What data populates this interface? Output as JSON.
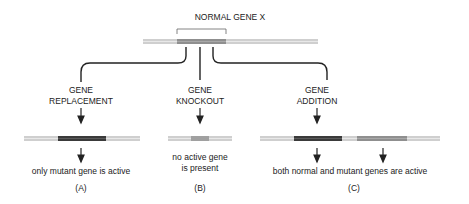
{
  "title": "NORMAL GENE X",
  "branches": [
    {
      "id": "A",
      "label_line1": "GENE",
      "label_line2": "REPLACEMENT",
      "result": "only mutant gene is active",
      "panel": "(A)"
    },
    {
      "id": "B",
      "label_line1": "GENE",
      "label_line2": "KNOCKOUT",
      "result_line1": "no active gene",
      "result_line2": "is present",
      "panel": "(B)"
    },
    {
      "id": "C",
      "label_line1": "GENE",
      "label_line2": "ADDITION",
      "result": "both normal and mutant genes are active",
      "panel": "(C)"
    }
  ],
  "colors": {
    "dna_light": "#c8c8c8",
    "normal_gene": "#909090",
    "mutant_gene": "#3a3a3a",
    "line": "#222222"
  }
}
